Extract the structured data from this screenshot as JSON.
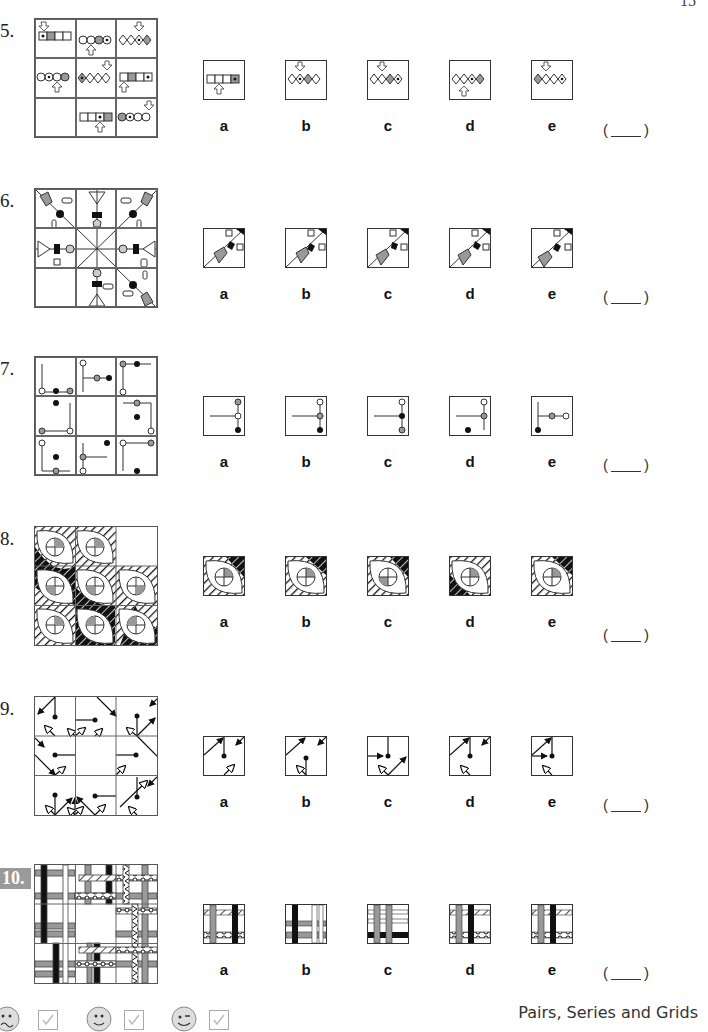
{
  "page": {
    "number": "15",
    "footer_title": "Pairs, Series and Grids"
  },
  "questions": [
    {
      "number": "5.",
      "options": [
        "a",
        "b",
        "c",
        "d",
        "e"
      ],
      "answer_blank": "( ____ )"
    },
    {
      "number": "6.",
      "options": [
        "a",
        "b",
        "c",
        "d",
        "e"
      ],
      "answer_blank": "( ____ )"
    },
    {
      "number": "7.",
      "options": [
        "a",
        "b",
        "c",
        "d",
        "e"
      ],
      "answer_blank": "( ____ )"
    },
    {
      "number": "8.",
      "options": [
        "a",
        "b",
        "c",
        "d",
        "e"
      ],
      "answer_blank": "( ____ )"
    },
    {
      "number": "9.",
      "options": [
        "a",
        "b",
        "c",
        "d",
        "e"
      ],
      "answer_blank": "( ____ )"
    },
    {
      "number": "10.",
      "options": [
        "a",
        "b",
        "c",
        "d",
        "e"
      ],
      "answer_blank": "( ____ )"
    }
  ],
  "footer": {
    "self_assessment": [
      {
        "icon": "sad-face-icon",
        "checkbox": "checkmark-icon"
      },
      {
        "icon": "smiley-face-icon",
        "checkbox": "checkmark-icon"
      },
      {
        "icon": "winking-face-icon",
        "checkbox": "checkmark-icon"
      }
    ]
  },
  "colors": {
    "grey_fill": "#9a9a9a",
    "black_fill": "#111111",
    "line": "#333333"
  }
}
